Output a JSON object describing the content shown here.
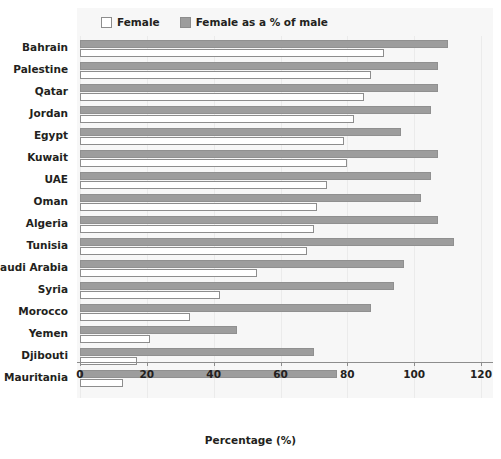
{
  "legend": {
    "entries": [
      {
        "label": "Female",
        "swatch": "white-square-icon",
        "color": "#ffffff"
      },
      {
        "label": "Female as a % of male",
        "swatch": "gray-square-icon",
        "color": "#9d9d9d"
      }
    ]
  },
  "axis": {
    "xlabel": "Percentage (%)",
    "ticks": [
      "0",
      "20",
      "40",
      "60",
      "80",
      "100",
      "120"
    ]
  },
  "chart_data": {
    "type": "bar",
    "orientation": "horizontal",
    "title": "",
    "xlabel": "Percentage (%)",
    "ylabel": "",
    "xlim": [
      0,
      120
    ],
    "xticks": [
      0,
      20,
      40,
      60,
      80,
      100,
      120
    ],
    "grid": true,
    "legend_position": "top-left",
    "categories": [
      "Bahrain",
      "Palestine",
      "Qatar",
      "Jordan",
      "Egypt",
      "Kuwait",
      "UAE",
      "Oman",
      "Algeria",
      "Tunisia",
      "Saudi Arabia",
      "Syria",
      "Morocco",
      "Yemen",
      "Djibouti",
      "Mauritania"
    ],
    "series": [
      {
        "name": "Female as a % of male",
        "color": "#9d9d9d",
        "values": [
          110,
          107,
          107,
          105,
          96,
          107,
          105,
          102,
          107,
          112,
          97,
          94,
          87,
          47,
          70,
          77
        ]
      },
      {
        "name": "Female",
        "color": "#ffffff",
        "values": [
          91,
          87,
          85,
          82,
          79,
          80,
          74,
          71,
          70,
          68,
          53,
          42,
          33,
          21,
          17,
          13
        ]
      }
    ]
  }
}
